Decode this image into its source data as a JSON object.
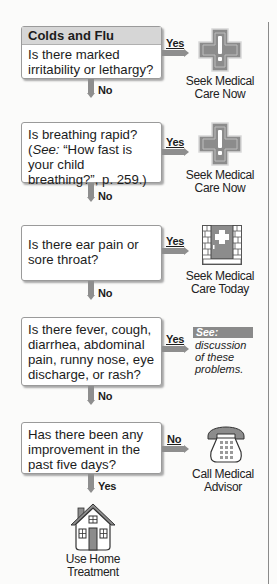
{
  "flowchart": {
    "title": "Colds and Flu",
    "steps": [
      {
        "question": "Is there marked irritability or lethargy?",
        "yes_label": "Yes",
        "no_label": "No",
        "yes_outcome": {
          "icon": "medical-cross-icon",
          "line1": "Seek Medical",
          "line2": "Care Now"
        }
      },
      {
        "question_parts": {
          "line1": "Is breathing rapid?",
          "see_prefix": "(",
          "see_word": "See:",
          "see_ref": " “How fast is your child breathing?”, p. 259.)"
        },
        "yes_label": "Yes",
        "no_label": "No",
        "yes_outcome": {
          "icon": "medical-cross-icon",
          "line1": "Seek Medical",
          "line2": "Care Now"
        }
      },
      {
        "question": "Is there ear pain or sore throat?",
        "yes_label": "Yes",
        "no_label": "No",
        "yes_outcome": {
          "icon": "clinic-door-icon",
          "line1": "Seek Medical",
          "line2": "Care Today"
        }
      },
      {
        "question": "Is there fever, cough, diarrhea, abdominal pain, runny nose, eye discharge, or rash?",
        "yes_label": "Yes",
        "no_label": "No",
        "yes_outcome": {
          "see_label": "See:",
          "text": "discussion of these problems."
        }
      },
      {
        "question": "Has there been any improvement in the past five days?",
        "no_label": "No",
        "yes_label": "Yes",
        "no_outcome": {
          "icon": "telephone-icon",
          "line1": "Call Medical",
          "line2": "Advisor"
        },
        "yes_outcome": {
          "icon": "house-icon",
          "line1": "Use Home",
          "line2": "Treatment"
        }
      }
    ]
  },
  "colors": {
    "icon_gray": "#8c8c8c",
    "box_header": "#d6d6d6",
    "arrow": "#8e8e8e",
    "see_tag": "#8a8a8a"
  }
}
